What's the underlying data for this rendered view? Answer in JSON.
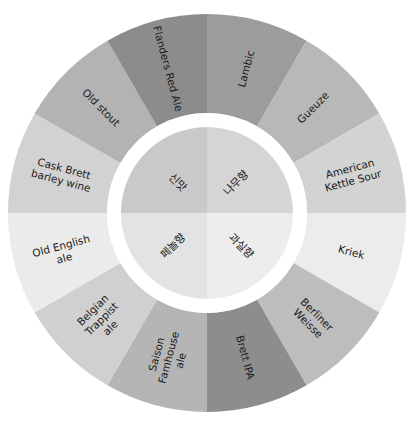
{
  "diagram": {
    "type": "sunburst-wheel",
    "center": {
      "x": 207,
      "y": 213
    },
    "outer_radius": 199,
    "ring_inner_radius": 100,
    "inner_radius": 86,
    "gap_color": "#ffffff",
    "inner_categories": [
      {
        "label": "나무향",
        "start": 0,
        "end": 90,
        "color": "#d5d5d5"
      },
      {
        "label": "과실향",
        "start": 90,
        "end": 180,
        "color": "#ededed"
      },
      {
        "label": "페놀향",
        "start": 180,
        "end": 270,
        "color": "#e3e3e3"
      },
      {
        "label": "신맛",
        "start": 270,
        "end": 360,
        "color": "#c9c9c9"
      }
    ],
    "outer_segments": [
      {
        "lines": [
          "Lambic"
        ],
        "start": 0,
        "end": 30,
        "color": "#9c9c9c"
      },
      {
        "lines": [
          "Gueuze"
        ],
        "start": 30,
        "end": 60,
        "color": "#b8b8b8"
      },
      {
        "lines": [
          "American",
          "Kettle Sour"
        ],
        "start": 60,
        "end": 90,
        "color": "#d3d3d3"
      },
      {
        "lines": [
          "Kriek"
        ],
        "start": 90,
        "end": 120,
        "color": "#ececec"
      },
      {
        "lines": [
          "Berliner",
          "Weisse"
        ],
        "start": 120,
        "end": 150,
        "color": "#bdbdbd"
      },
      {
        "lines": [
          "Brett IPA"
        ],
        "start": 150,
        "end": 180,
        "color": "#8d8d8d"
      },
      {
        "lines": [
          "Saison",
          "Famhouse",
          "ale"
        ],
        "start": 180,
        "end": 210,
        "color": "#b5b5b5"
      },
      {
        "lines": [
          "Belgian",
          "Trappist",
          "ale"
        ],
        "start": 210,
        "end": 240,
        "color": "#d0d0d0"
      },
      {
        "lines": [
          "Old English",
          "ale"
        ],
        "start": 240,
        "end": 270,
        "color": "#ebebeb"
      },
      {
        "lines": [
          "Cask Brett",
          "barley wine"
        ],
        "start": 270,
        "end": 300,
        "color": "#d2d2d2"
      },
      {
        "lines": [
          "Old stout"
        ],
        "start": 300,
        "end": 330,
        "color": "#b3b3b3"
      },
      {
        "lines": [
          "Flanders Red Ale"
        ],
        "start": 330,
        "end": 360,
        "color": "#8c8c8c"
      }
    ]
  }
}
